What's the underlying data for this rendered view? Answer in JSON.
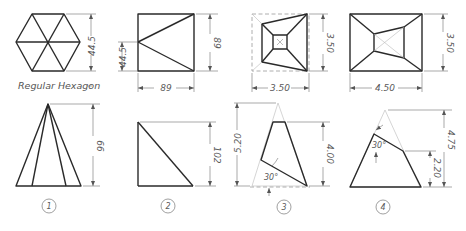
{
  "sheet": {
    "title": "Geometric construction exercises"
  },
  "top_row": {
    "hexagon": {
      "caption": "Regular Hexagon",
      "dim_height": "44.5"
    },
    "square_triangle": {
      "dim_left": "44.5",
      "dim_right": "89",
      "dim_bottom": "89"
    },
    "frustum_top_view": {
      "dim_right": "3.50",
      "dim_bottom": "3.50"
    },
    "rect_frustum_top_view": {
      "dim_right": "3.50",
      "dim_bottom": "4.50"
    }
  },
  "bottom_row": {
    "pyramid": {
      "dim_height": "66",
      "number": "1"
    },
    "wedge": {
      "dim_height": "102",
      "number": "2"
    },
    "truncated_3": {
      "dim_left": "5.20",
      "dim_right": "4.00",
      "angle": "30°",
      "number": "3"
    },
    "truncated_4": {
      "dim_total": "4.75",
      "dim_lower": "2.20",
      "angle": "30°",
      "number": "4"
    }
  }
}
